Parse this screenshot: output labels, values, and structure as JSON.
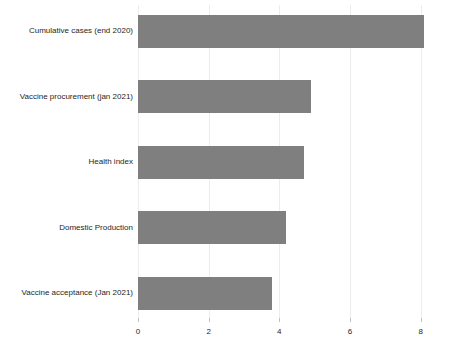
{
  "chart_data": {
    "type": "bar",
    "orientation": "horizontal",
    "title": "",
    "xlabel": "",
    "ylabel": "",
    "categories": [
      "Cumulative cases (end 2020)",
      "Vaccine procurement (jan 2021)",
      "Health index",
      "Domestic Production",
      "Vaccine acceptance (Jan 2021)"
    ],
    "values": [
      8.1,
      4.9,
      4.7,
      4.2,
      3.8
    ],
    "xticks": [
      "0",
      "2",
      "4",
      "6",
      "8"
    ],
    "xtick_values": [
      0,
      2,
      4,
      6,
      8
    ],
    "xlim": [
      0,
      9
    ],
    "grid": true,
    "legend": false,
    "bar_color": "#7f7f7f",
    "gridline_color": "#ececec",
    "tick_mark_color": "#c2c2c2",
    "text_color": "#262626",
    "background_color": "#ffffff"
  }
}
